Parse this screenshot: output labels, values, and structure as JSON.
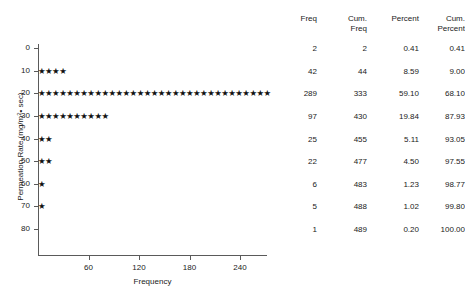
{
  "chart_data": {
    "type": "scatter",
    "title": "",
    "xlabel": "Frequency",
    "ylabel": "Permeation Rate (mg/m2• sec)",
    "ylabel_parts": {
      "prefix": "Permeation Rate (mg/m",
      "superscript": "2",
      "suffix": "• sec)"
    },
    "x": [
      2,
      42,
      289,
      97,
      25,
      22,
      6,
      5,
      1
    ],
    "categories": [
      "0",
      "10",
      "20",
      "30",
      "40",
      "50",
      "60",
      "70",
      "80"
    ],
    "values": [
      2,
      42,
      289,
      97,
      25,
      22,
      6,
      5,
      1
    ],
    "marker": "star",
    "marker_unit": 10,
    "xlim": [
      0,
      272
    ],
    "ylim": [
      0,
      80
    ],
    "xticks": [
      "60",
      "120",
      "180",
      "240"
    ],
    "xtick_values": [
      60,
      120,
      180,
      240
    ],
    "yticks": [
      "0",
      "10",
      "20",
      "30",
      "40",
      "50",
      "60",
      "70",
      "80"
    ],
    "ytick_values": [
      0,
      10,
      20,
      30,
      40,
      50,
      60,
      70,
      80
    ],
    "grid": false,
    "legend": "none",
    "stars_per_row": [
      0,
      4,
      33,
      10,
      2,
      2,
      1,
      1,
      0
    ]
  },
  "table": {
    "headers": [
      {
        "line1": "Freq",
        "line2": ""
      },
      {
        "line1": "Cum.",
        "line2": "Freq"
      },
      {
        "line1": "Percent",
        "line2": ""
      },
      {
        "line1": "Cum.",
        "line2": "Percent"
      }
    ],
    "rows": [
      {
        "freq": "2",
        "cum_freq": "2",
        "percent": "0.41",
        "cum_percent": "0.41"
      },
      {
        "freq": "42",
        "cum_freq": "44",
        "percent": "8.59",
        "cum_percent": "9.00"
      },
      {
        "freq": "289",
        "cum_freq": "333",
        "percent": "59.10",
        "cum_percent": "68.10"
      },
      {
        "freq": "97",
        "cum_freq": "430",
        "percent": "19.84",
        "cum_percent": "87.93"
      },
      {
        "freq": "25",
        "cum_freq": "455",
        "percent": "5.11",
        "cum_percent": "93.05"
      },
      {
        "freq": "22",
        "cum_freq": "477",
        "percent": "4.50",
        "cum_percent": "97.55"
      },
      {
        "freq": "6",
        "cum_freq": "483",
        "percent": "1.23",
        "cum_percent": "98.77"
      },
      {
        "freq": "5",
        "cum_freq": "488",
        "percent": "1.02",
        "cum_percent": "99.80"
      },
      {
        "freq": "1",
        "cum_freq": "489",
        "percent": "0.20",
        "cum_percent": "100.00"
      }
    ]
  },
  "style": {
    "axis_color": "#5a5a5a",
    "text_color": "#1a1a1a",
    "marker_color": "#111111",
    "background": "#ffffff"
  }
}
